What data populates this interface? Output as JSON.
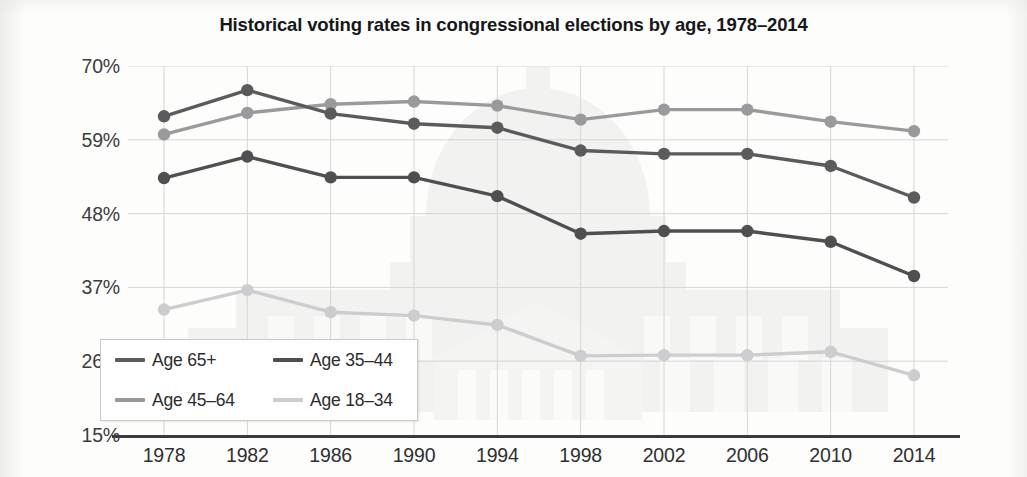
{
  "title": "Historical voting rates in congressional elections by age, 1978–2014",
  "axis": {
    "y_ticks": [
      "70%",
      "59%",
      "48%",
      "37%",
      "26%",
      "15%"
    ],
    "x_ticks": [
      "1978",
      "1982",
      "1986",
      "1990",
      "1994",
      "1998",
      "2002",
      "2006",
      "2010",
      "2014"
    ]
  },
  "legend": {
    "items": [
      {
        "label": "Age 65+",
        "color": "#5b5b5d"
      },
      {
        "label": "Age 35–44",
        "color": "#4f4f51"
      },
      {
        "label": "Age 45–64",
        "color": "#9a9a9c"
      },
      {
        "label": "Age 18–34",
        "color": "#cdcdcf"
      }
    ]
  },
  "colors": {
    "grid": "#d6d6d4",
    "axis": "#3a3a3c",
    "text": "#2f2f31",
    "background": "#fdfdfc",
    "watermark": "#e6e6e4"
  },
  "chart_data": {
    "type": "line",
    "title": "Historical voting rates in congressional elections by age, 1978–2014",
    "xlabel": "",
    "ylabel": "",
    "x": [
      1978,
      1982,
      1986,
      1990,
      1994,
      1998,
      2002,
      2006,
      2010,
      2014
    ],
    "categories": [
      "1978",
      "1982",
      "1986",
      "1990",
      "1994",
      "1998",
      "2002",
      "2006",
      "2010",
      "2014"
    ],
    "ylim": [
      15,
      70
    ],
    "yticks": [
      15,
      26,
      37,
      48,
      59,
      70
    ],
    "ytick_labels": [
      "15%",
      "26%",
      "37%",
      "48%",
      "59%",
      "70%"
    ],
    "grid": true,
    "legend_position": "bottom-left",
    "series": [
      {
        "name": "Age 65+",
        "color": "#5b5b5d",
        "values": [
          62.5,
          66.4,
          62.9,
          61.4,
          60.8,
          57.4,
          56.9,
          56.9,
          55.1,
          50.4
        ]
      },
      {
        "name": "Age 45–64",
        "color": "#9a9a9c",
        "values": [
          59.8,
          63.0,
          64.3,
          64.7,
          64.1,
          62.0,
          63.5,
          63.5,
          61.7,
          60.3
        ]
      },
      {
        "name": "Age 35–44",
        "color": "#4f4f51",
        "values": [
          53.3,
          56.5,
          53.4,
          53.4,
          50.6,
          45.0,
          45.4,
          45.4,
          43.8,
          38.7
        ]
      },
      {
        "name": "Age 18–34",
        "color": "#cdcdcf",
        "values": [
          33.7,
          36.6,
          33.3,
          32.8,
          31.4,
          26.8,
          26.9,
          26.9,
          27.4,
          23.9
        ]
      }
    ]
  }
}
